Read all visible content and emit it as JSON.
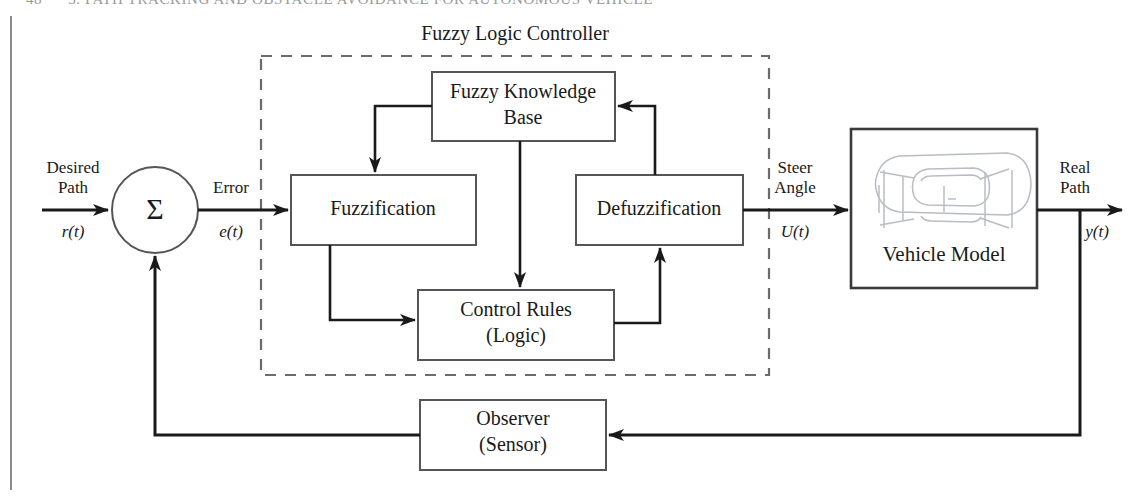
{
  "page": {
    "running_head": {
      "folio": "48",
      "text": "3. PATH TRACKING AND OBSTACLE AVOIDANCE FOR AUTONOMOUS VEHICLE"
    }
  },
  "diagram": {
    "type": "block-diagram",
    "controller_title": "Fuzzy Logic Controller",
    "blocks": {
      "fuzzy_knowledge_base": {
        "line1": "Fuzzy Knowledge",
        "line2": "Base"
      },
      "fuzzification": {
        "line1": "Fuzzification"
      },
      "defuzzification": {
        "line1": "Defuzzification"
      },
      "control_rules": {
        "line1": "Control Rules",
        "line2": "(Logic)"
      },
      "vehicle_model": {
        "line1": "Vehicle Model",
        "icon": "car-top-view-icon"
      },
      "observer": {
        "line1": "Observer",
        "line2": "(Sensor)"
      },
      "summing_junction": {
        "glyph": "Σ"
      }
    },
    "signals": {
      "input": {
        "line1": "Desired",
        "line2": "Path",
        "symbol": "r(t)"
      },
      "error": {
        "line1": "Error",
        "symbol": "e(t)"
      },
      "control": {
        "line1": "Steer",
        "line2": "Angle",
        "symbol": "U(t)"
      },
      "output": {
        "line1": "Real",
        "line2": "Path",
        "symbol": "y(t)"
      }
    },
    "colors": {
      "ink": "#1a1a1a",
      "box_stroke": "#555555",
      "dashed_stroke": "#6b6b6b",
      "car_stroke": "#b9bcc4",
      "page_rule": "#8c8c8c",
      "runhead": "#9a9a9a"
    }
  }
}
